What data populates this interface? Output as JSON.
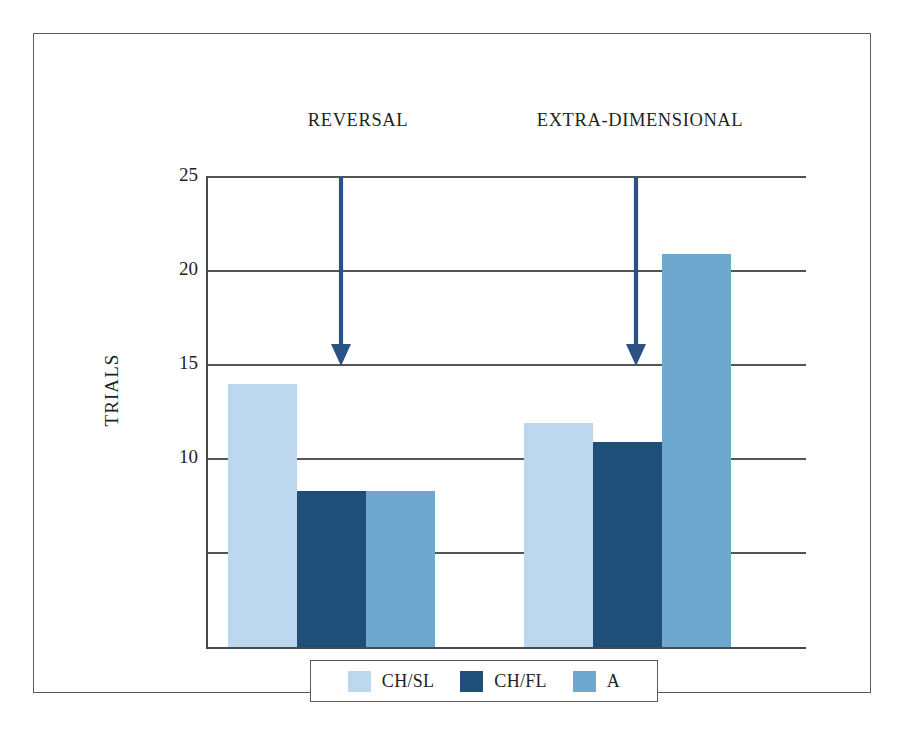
{
  "figure": {
    "y_axis_title": "TRIALS"
  },
  "chart_data": {
    "type": "bar",
    "title": "",
    "xlabel": "",
    "ylabel": "TRIALS",
    "ylim": [
      0,
      25
    ],
    "ytick_values": [
      25,
      20,
      15,
      10,
      5,
      0
    ],
    "ytick_labels": [
      "25",
      "20",
      "15",
      "10",
      "",
      ""
    ],
    "grid": true,
    "gridlines_at": [
      25,
      20,
      15,
      10,
      5
    ],
    "legend_position": "bottom",
    "categories": [
      "REVERSAL",
      "EXTRA-DIMENSIONAL"
    ],
    "series": [
      {
        "name": "CH/SL",
        "color": "#bdd7ee",
        "values": [
          14.0,
          11.9
        ]
      },
      {
        "name": "CH/FL",
        "color": "#1f4e79",
        "values": [
          8.3,
          10.9
        ]
      },
      {
        "name": "A",
        "color": "#6fa8cf",
        "values": [
          8.3,
          20.9
        ]
      }
    ],
    "annotations": [
      {
        "label": "reversal-arrow",
        "group": "REVERSAL",
        "from_y": 25,
        "to_y": 15,
        "color": "#2c5284"
      },
      {
        "label": "extra-dimensional-arrow",
        "group": "EXTRA-DIMENSIONAL",
        "from_y": 25,
        "to_y": 15,
        "color": "#2c5284"
      }
    ]
  },
  "group_labels": [
    {
      "text": "REVERSAL"
    },
    {
      "text": "EXTRA-DIMENSIONAL"
    }
  ],
  "legend": {
    "items": [
      {
        "label": "CH/SL",
        "color": "#bdd7ee"
      },
      {
        "label": "CH/FL",
        "color": "#1f4e79"
      },
      {
        "label": "A",
        "color": "#6fa8cf"
      }
    ]
  },
  "colors": {
    "series_ch_sl": "#bdd7ee",
    "series_ch_fl": "#1f4e79",
    "series_a": "#6fa8cf",
    "arrow": "#2c5284",
    "axis": "#4a4a4a",
    "gridline": "#545454",
    "frame": "#5a5a5a",
    "text": "#231f20"
  }
}
